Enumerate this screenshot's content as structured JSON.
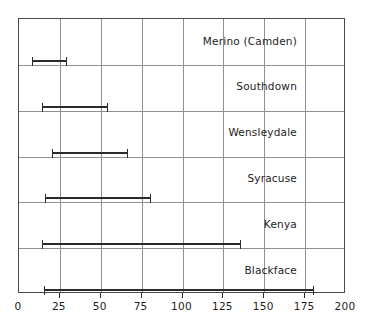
{
  "chart_data": {
    "type": "bar",
    "subtype": "range-bar",
    "title": "",
    "subtitle": "",
    "xlabel": "",
    "ylabel": "",
    "xlim": [
      0,
      200
    ],
    "xticks": [
      0,
      25,
      50,
      75,
      100,
      125,
      150,
      175,
      200
    ],
    "xtick_labels": [
      "0",
      "25",
      "50",
      "75",
      "100",
      "125",
      "150",
      "175",
      "200"
    ],
    "grid": true,
    "legend": null,
    "categories": [
      "Merino (Camden)",
      "Southdown",
      "Wensleydale",
      "Syracuse",
      "Kenya",
      "Blackface"
    ],
    "ranges": [
      {
        "label": "Merino (Camden)",
        "low": 8,
        "high": 29
      },
      {
        "label": "Southdown",
        "low": 14,
        "high": 54
      },
      {
        "label": "Wensleydale",
        "low": 20,
        "high": 66
      },
      {
        "label": "Syracuse",
        "low": 16,
        "high": 80
      },
      {
        "label": "Kenya",
        "low": 14,
        "high": 135
      },
      {
        "label": "Blackface",
        "low": 15,
        "high": 180
      }
    ],
    "colors": {
      "bar": "#2b2b2b",
      "grid": "#8f8f8f",
      "border": "#4a4a4a",
      "text": "#1c1c1c",
      "background": "#ffffff"
    }
  },
  "axis": {
    "x": {
      "labels": [
        "0",
        "25",
        "50",
        "75",
        "100",
        "125",
        "150",
        "175",
        "200"
      ]
    }
  },
  "rows": [
    {
      "label": "Merino (Camden)"
    },
    {
      "label": "Southdown"
    },
    {
      "label": "Wensleydale"
    },
    {
      "label": "Syracuse"
    },
    {
      "label": "Kenya"
    },
    {
      "label": "Blackface"
    }
  ]
}
